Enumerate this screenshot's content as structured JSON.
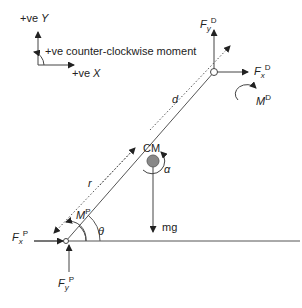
{
  "legend": {
    "y_axis": {
      "prefix": "+ve ",
      "var": "Y"
    },
    "x_axis": {
      "prefix": "+ve ",
      "var": "X"
    },
    "moment": "+ve counter-clockwise moment"
  },
  "labels": {
    "fyD": {
      "main": "F",
      "sub": "y",
      "sup": "D"
    },
    "fxD": {
      "main": "F",
      "sub": "x",
      "sup": "D"
    },
    "mD": {
      "main": "M",
      "sup": "D"
    },
    "d": "d",
    "cm": "CM",
    "alpha": "α",
    "r": "r",
    "mP": {
      "main": "M",
      "sup": "P"
    },
    "theta": "θ",
    "mg": "mg",
    "fxP": {
      "main": "F",
      "sub": "x",
      "sup": "P"
    },
    "fyP": {
      "main": "F",
      "sub": "y",
      "sup": "P"
    }
  },
  "colors": {
    "line": "#555555",
    "text": "#222222",
    "mass": "#888888"
  }
}
